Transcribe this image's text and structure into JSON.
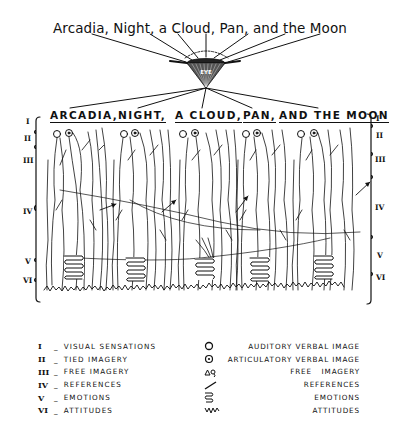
{
  "title": "Arcadia, Night, a Cloud, Pan, and the Moon",
  "funnel_label": "EYE",
  "words": [
    {
      "label": "ARCADIA,",
      "x": 50
    },
    {
      "label": "NIGHT,",
      "x": 118
    },
    {
      "label": "A CLOUD,",
      "x": 175
    },
    {
      "label": "PAN,",
      "x": 243
    },
    {
      "label": "AND THE MOON",
      "x": 279
    }
  ],
  "levels_left": [
    "I",
    "II",
    "III",
    "IV",
    "V",
    "VI"
  ],
  "levels_right": [
    "I",
    "II",
    "III",
    "IV",
    "V",
    "VI"
  ],
  "legend_levels": [
    {
      "numeral": "I",
      "label": "VISUAL SENSATIONS"
    },
    {
      "numeral": "II",
      "label": "TIED IMAGERY"
    },
    {
      "numeral": "III",
      "label": "FREE IMAGERY"
    },
    {
      "numeral": "IV",
      "label": "REFERENCES"
    },
    {
      "numeral": "V",
      "label": "EMOTIONS"
    },
    {
      "numeral": "VI",
      "label": "ATTITUDES"
    }
  ],
  "legend_symbols": [
    {
      "icon": "open-circle",
      "label": "AUDITORY VERBAL IMAGE"
    },
    {
      "icon": "dotted-circle",
      "label": "ARTICULATORY VERBAL IMAGE"
    },
    {
      "icon": "free-imagery-glyph",
      "label": "FREE   IMAGERY"
    },
    {
      "icon": "arrow-line",
      "label": "REFERENCES"
    },
    {
      "icon": "coil",
      "label": "EMOTIONS"
    },
    {
      "icon": "zigzag",
      "label": "ATTITUDES"
    }
  ],
  "colors": {
    "ink": "#111111",
    "paper": "#ffffff"
  }
}
